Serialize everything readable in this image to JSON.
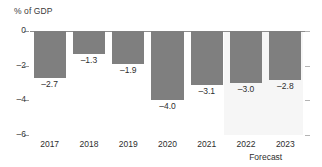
{
  "chart_data": {
    "type": "bar",
    "title": "",
    "ylabel": "% of GDP",
    "xlabel": "",
    "categories": [
      "2017",
      "2018",
      "2019",
      "2020",
      "2021",
      "2022",
      "2023"
    ],
    "values": [
      -2.7,
      -1.3,
      -1.9,
      -4.0,
      -3.1,
      -3.0,
      -2.8
    ],
    "value_labels": [
      "–2.7",
      "–1.3",
      "–1.9",
      "–4.0",
      "–3.1",
      "–3.0",
      "–2.8"
    ],
    "ylim": [
      -6,
      0
    ],
    "yticks": [
      0,
      -2,
      -4,
      -6
    ],
    "ytick_labels": [
      "0",
      "–2",
      "–4",
      "–6"
    ],
    "grid": false,
    "legend": null,
    "annotations": [
      {
        "text": "Forecast",
        "covers": [
          "2022",
          "2023"
        ]
      }
    ],
    "series_color": "#7f7f7f",
    "forecast_band_color": "#f6f6f6",
    "axis_color": "#8c8c8c"
  },
  "axis": {
    "y_title": "% of GDP"
  },
  "annotation": {
    "forecast": "Forecast"
  }
}
